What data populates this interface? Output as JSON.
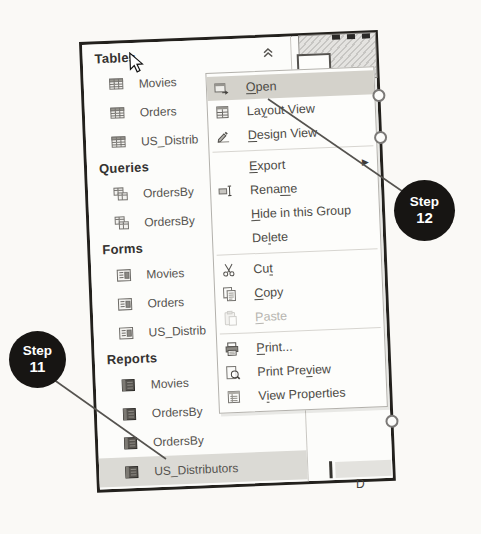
{
  "page": {
    "step_callouts": [
      {
        "id": "step-12",
        "line1": "Step",
        "line2": "12"
      },
      {
        "id": "step-11",
        "line1": "Step",
        "line2": "11"
      }
    ],
    "background_fragment_text": "D"
  },
  "colors": {
    "menu_highlight": "#d4d2cb",
    "selection_highlight": "#dbdad5",
    "callout_bg": "#171513"
  },
  "nav_pane": {
    "sections": [
      {
        "title": "Tables",
        "icon": "table",
        "collapse_chevron": true,
        "items": [
          "Movies",
          "Orders",
          "US_Distrib"
        ]
      },
      {
        "title": "Queries",
        "icon": "query",
        "items": [
          "OrdersBy",
          "OrdersBy"
        ]
      },
      {
        "title": "Forms",
        "icon": "form",
        "items": [
          "Movies",
          "Orders",
          "US_Distrib"
        ]
      },
      {
        "title": "Reports",
        "icon": "report",
        "items": [
          "Movies",
          "OrdersBy",
          "OrdersBy",
          "US_Distributors"
        ],
        "selected_item": "US_Distributors"
      }
    ]
  },
  "context_menu": {
    "items": [
      {
        "label": "Open",
        "mnemonic_index": 0,
        "icon": "open",
        "highlighted": true
      },
      {
        "label": "Layout View",
        "mnemonic_index": 2,
        "icon": "layout-view"
      },
      {
        "label": "Design View",
        "mnemonic_index": 0,
        "icon": "design-view"
      },
      {
        "separator": true
      },
      {
        "label": "Export",
        "mnemonic_index": 0,
        "has_submenu": true
      },
      {
        "label": "Rename",
        "mnemonic_index": 4,
        "icon": "rename"
      },
      {
        "label": "Hide in this Group",
        "mnemonic_index": 0
      },
      {
        "label": "Delete",
        "mnemonic_index": 2
      },
      {
        "separator": true
      },
      {
        "label": "Cut",
        "mnemonic_index": 2,
        "icon": "cut"
      },
      {
        "label": "Copy",
        "mnemonic_index": 0,
        "icon": "copy"
      },
      {
        "label": "Paste",
        "mnemonic_index": 0,
        "icon": "paste",
        "disabled": true
      },
      {
        "separator": true
      },
      {
        "label": "Print...",
        "mnemonic_index": 0,
        "icon": "print"
      },
      {
        "label": "Print Preview",
        "mnemonic_index": 9,
        "icon": "print-preview"
      },
      {
        "label": "View Properties",
        "mnemonic_index": 1,
        "icon": "view-properties"
      }
    ]
  }
}
